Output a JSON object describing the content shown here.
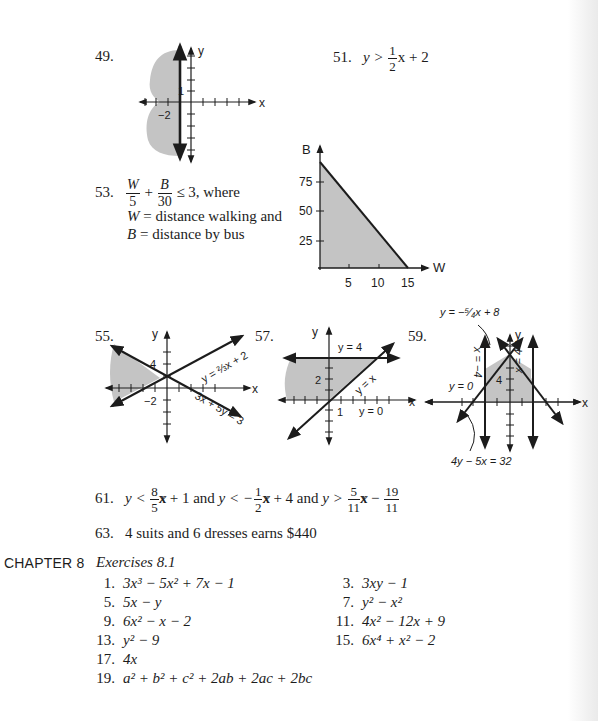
{
  "page": {
    "background": "#ffffff",
    "ink": "#1c1c1c",
    "shade": "#c4c4c4"
  },
  "problems": {
    "p49": {
      "number": "49.",
      "graph": {
        "x_label": "x",
        "y_label": "y",
        "tick_label_y": "1",
        "tick_label_x": "−2",
        "boundary": "x = −1",
        "shaded": "x ≤ −1 (left of vertical line)"
      }
    },
    "p51": {
      "number": "51.",
      "lhs": "y >",
      "frac_num": "1",
      "frac_den": "2",
      "rhs": "x + 2"
    },
    "p53": {
      "number": "53.",
      "w": "W",
      "w_den": "5",
      "plus": "+",
      "b": "B",
      "b_den": "30",
      "cond": "≤ 3, where",
      "line2_var": "W",
      "line2_text": " = distance walking and",
      "line3_var": "B",
      "line3_text": " = distance by bus",
      "graph": {
        "x_label": "W",
        "y_label": "B",
        "x_ticks": [
          "5",
          "10",
          "15"
        ],
        "y_ticks": [
          "25",
          "50",
          "75"
        ]
      }
    },
    "p55": {
      "number": "55.",
      "graph": {
        "x_label": "x",
        "y_label": "y",
        "tick_label_y": "4",
        "tick_label_x": "−2",
        "line1": "y = ⅔x + 2",
        "line2": "3x + 5y = 3"
      }
    },
    "p57": {
      "number": "57.",
      "graph": {
        "x_label": "x",
        "y_label": "y",
        "tick_label_y": "2",
        "tick_label_x": "1",
        "line_top": "y = 4",
        "line_diag": "y = x",
        "line_bottom": "y = 0"
      }
    },
    "p59": {
      "number": "59.",
      "graph": {
        "x_label": "x",
        "y_label": "y",
        "tick_label_y": "4",
        "label_top": "y = −⁵⁄₄x + 8",
        "label_left_vert": "x = −4",
        "label_right_vert": "x = 4",
        "label_y0": "y = 0",
        "label_bottom": "4y − 5x = 32"
      }
    },
    "p61": {
      "number": "61.",
      "a": "y <",
      "f1n": "8",
      "f1d": "5",
      "a2": "x + 1 and",
      "b": "y < −",
      "f2n": "1",
      "f2d": "2",
      "b2": "x + 4 and",
      "c": "y >",
      "f3n": "5",
      "f3d": "11",
      "c2": "x −",
      "f4n": "19",
      "f4d": "11"
    },
    "p63": {
      "number": "63.",
      "text": "4 suits and 6 dresses earns $440"
    }
  },
  "chapter": {
    "label": "CHAPTER 8",
    "section": "Exercises 8.1",
    "answers": [
      {
        "n": "1.",
        "text": "3x³ − 5x² + 7x − 1"
      },
      {
        "n": "3.",
        "text": "3xy − 1"
      },
      {
        "n": "5.",
        "text": "5x − y"
      },
      {
        "n": "7.",
        "text": "y² − x²"
      },
      {
        "n": "9.",
        "text": "6x² − x − 2"
      },
      {
        "n": "11.",
        "text": "4x² − 12x + 9"
      },
      {
        "n": "13.",
        "text": "y² − 9"
      },
      {
        "n": "15.",
        "text": "6x⁴ + x² − 2"
      },
      {
        "n": "17.",
        "text": "4x"
      },
      {
        "n": "19.",
        "text": "a² + b² + c² + 2ab + 2ac + 2bc"
      }
    ]
  }
}
